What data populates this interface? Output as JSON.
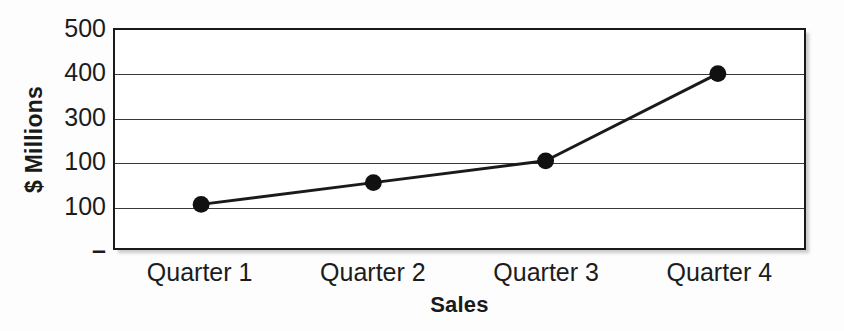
{
  "chart_data": {
    "type": "line",
    "title": "",
    "xlabel": "Sales",
    "ylabel": "$ Millions",
    "categories": [
      "Quarter 1",
      "Quarter 2",
      "Quarter 3",
      "Quarter 4"
    ],
    "values": [
      100,
      150,
      200,
      400
    ],
    "series": [
      {
        "name": "Sales",
        "values": [
          100,
          150,
          200,
          400
        ]
      }
    ],
    "ylim": [
      0,
      500
    ],
    "y_tick_values": [
      500,
      400,
      300,
      200,
      100,
      0
    ],
    "y_tick_labels": [
      "500",
      "400",
      "300",
      "100",
      "100",
      "–"
    ],
    "grid": true,
    "gridlines": "horizontal",
    "legend": "none",
    "marker": "filled-circle",
    "line_color": "#1a1a1a",
    "marker_color": "#111111",
    "frame_color": "#1a1a1a",
    "gridline_color": "#3a3a3a",
    "background_color": "#ffffff",
    "note": "Y-axis tick labels are reproduced verbatim from the source image; the fourth label reads '100' where 200 would be expected."
  }
}
